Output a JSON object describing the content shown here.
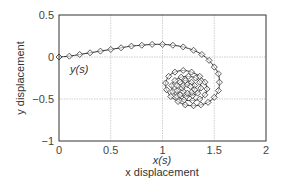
{
  "chart_data": {
    "type": "line",
    "title": "",
    "xlabel": "x displacement",
    "ylabel": "y displacement",
    "x_series_label": "x(s)",
    "y_series_label": "y(s)",
    "xlim": [
      0,
      2
    ],
    "ylim": [
      -1,
      0.5
    ],
    "xticks": [
      "0",
      "0.5",
      "1",
      "1.5",
      "2"
    ],
    "yticks": [
      "0.5",
      "0",
      "-0.5",
      "-1"
    ],
    "grid": true,
    "marker": "diamond",
    "series": [
      {
        "name": "spiral trajectory",
        "x": [
          0,
          0.1,
          0.2,
          0.3,
          0.4,
          0.5,
          0.6,
          0.7,
          0.8,
          0.9,
          1.0,
          1.1,
          1.2,
          1.3,
          1.38,
          1.45,
          1.5,
          1.54,
          1.55,
          1.54,
          1.5,
          1.44,
          1.37,
          1.3,
          1.22,
          1.15,
          1.08,
          1.04,
          1.03,
          1.06,
          1.12,
          1.2,
          1.28,
          1.36,
          1.41,
          1.43,
          1.41,
          1.36,
          1.29,
          1.21,
          1.14,
          1.1,
          1.09,
          1.12,
          1.18,
          1.25,
          1.32,
          1.36,
          1.37,
          1.34,
          1.29,
          1.23,
          1.17,
          1.14,
          1.14,
          1.17,
          1.22,
          1.28,
          1.31,
          1.31,
          1.28,
          1.24,
          1.2,
          1.19,
          1.2,
          1.24,
          1.27
        ],
        "y": [
          0,
          0.01,
          0.03,
          0.05,
          0.07,
          0.09,
          0.11,
          0.13,
          0.14,
          0.15,
          0.15,
          0.14,
          0.12,
          0.08,
          0.03,
          -0.04,
          -0.12,
          -0.2,
          -0.3,
          -0.4,
          -0.48,
          -0.54,
          -0.57,
          -0.58,
          -0.57,
          -0.53,
          -0.47,
          -0.39,
          -0.31,
          -0.23,
          -0.18,
          -0.16,
          -0.18,
          -0.23,
          -0.3,
          -0.38,
          -0.45,
          -0.5,
          -0.52,
          -0.51,
          -0.47,
          -0.41,
          -0.34,
          -0.28,
          -0.24,
          -0.23,
          -0.25,
          -0.3,
          -0.37,
          -0.43,
          -0.46,
          -0.47,
          -0.45,
          -0.4,
          -0.34,
          -0.3,
          -0.28,
          -0.3,
          -0.34,
          -0.39,
          -0.42,
          -0.43,
          -0.41,
          -0.37,
          -0.34,
          -0.33,
          -0.35
        ]
      }
    ]
  },
  "colors": {
    "line": "#333333",
    "grid": "#bbbbbb",
    "axes": "#333333",
    "marker_fill": "#ffffff"
  }
}
